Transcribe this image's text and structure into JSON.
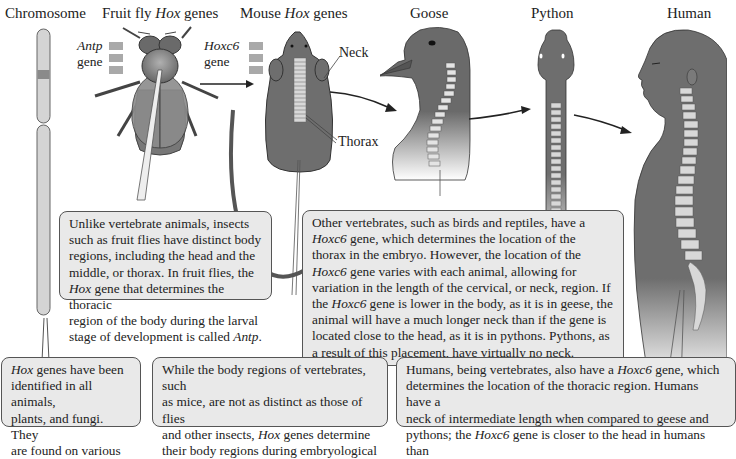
{
  "titles": {
    "chromosome": "Chromosome",
    "fruit_fly_pre": "Fruit fly ",
    "fruit_fly_hox": "Hox",
    "fruit_fly_post": " genes",
    "mouse_pre": "Mouse ",
    "mouse_hox": "Hox",
    "mouse_post": " genes",
    "goose": "Goose",
    "python": "Python",
    "human": "Human"
  },
  "gene_labels": {
    "fly_gene_name": "Antp",
    "fly_gene_word": "gene",
    "mouse_gene_name": "Hoxc6",
    "mouse_gene_word": "gene"
  },
  "part_labels": {
    "neck": "Neck",
    "thorax": "Thorax"
  },
  "colors": {
    "body_gray": "#6e6e6e",
    "callout_bg": "#e9e9e9",
    "vertebra": "#d8d8d8",
    "gene_box": "#a9a9a9"
  },
  "callouts": {
    "fly": {
      "l1": "Unlike vertebrate animals, insects",
      "l2": "such as fruit flies have distinct body",
      "l3": "regions, including the head and the",
      "l4": "middle, or thorax. In fruit flies, the",
      "l5_i": "Hox",
      "l5": " gene that determines the thoracic",
      "l6": "region of the body during the larval",
      "l7_pre": "stage of development is called ",
      "l7_i": "Antp",
      "l7_post": "."
    },
    "birds_reptiles": {
      "l1": "Other vertebrates, such as birds and reptiles, have a",
      "l2_i": "Hoxc6",
      "l2": " gene, which determines the location of the",
      "l3": "thorax in the embryo. However, the location of the",
      "l4_i": "Hoxc6",
      "l4": " gene varies with each animal, allowing for",
      "l5": "variation in the length of the cervical, or neck, region. If",
      "l6_pre": "the ",
      "l6_i": "Hoxc6",
      "l6_post": " gene is lower in the body, as it is in geese, the",
      "l7": "animal will have a much longer neck than if the gene is",
      "l8": "located close to the head, as it is in pythons. Pythons, as",
      "l9": "a result of this placement, have virtually no neck."
    },
    "hox_all": {
      "l1_i": "Hox",
      "l1": " genes have been",
      "l2": "identified in all animals,",
      "l3": "plants, and fungi. They",
      "l4": "are found on various"
    },
    "mice": {
      "l1": "While the body regions of vertebrates, such",
      "l2": "as mice, are not as distinct as those of flies",
      "l3_pre": "and other insects, ",
      "l3_i": "Hox",
      "l3_post": " genes determine",
      "l4": "their body regions during embryological"
    },
    "humans": {
      "l1_pre": "Humans, being vertebrates, also have a ",
      "l1_i": "Hoxc6",
      "l1_post": " gene, which",
      "l2": "determines the location of the thoracic region. Humans have a",
      "l3": "neck of intermediate length when compared to geese and",
      "l4_pre": "pythons; the ",
      "l4_i": "Hoxc6",
      "l4_post": " gene is closer to the head in humans than"
    }
  }
}
